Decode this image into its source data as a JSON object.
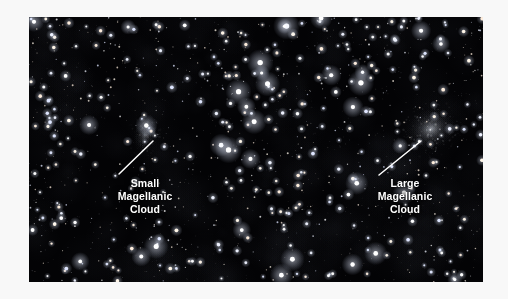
{
  "page": {
    "background_color": "#f8f8f8",
    "type": "astronomical-photograph"
  },
  "photo": {
    "background_color": "#030305",
    "description": "Dense night sky star field containing the two Magellanic Clouds",
    "frame": {
      "x": 29,
      "y": 17,
      "width": 454,
      "height": 265
    }
  },
  "annotations": [
    {
      "id": "small-magellanic-cloud",
      "lines": [
        "Small",
        "Magellanic",
        "Cloud"
      ],
      "text_color": "#ffffff",
      "leader_line": {
        "x1": 90,
        "y1": 157,
        "x2": 124,
        "y2": 124
      },
      "target": {
        "x": 117,
        "y": 118
      }
    },
    {
      "id": "large-magellanic-cloud",
      "lines": [
        "Large",
        "Magellanic",
        "Cloud"
      ],
      "text_color": "#ffffff",
      "leader_line": {
        "x1": 350,
        "y1": 158,
        "x2": 392,
        "y2": 124
      },
      "target": {
        "x": 399,
        "y": 117
      }
    }
  ],
  "objects": [
    {
      "name": "Small Magellanic Cloud",
      "center": {
        "x": 116,
        "y": 118
      },
      "radius_x": 13,
      "radius_y": 20,
      "rotation_deg": 15,
      "brightness": 0.34,
      "glow_color": "#cfd4de"
    },
    {
      "name": "Large Magellanic Cloud",
      "center": {
        "x": 402,
        "y": 112
      },
      "radius_x": 26,
      "radius_y": 21,
      "rotation_deg": -20,
      "brightness": 0.62,
      "glow_color": "#dde2ea"
    }
  ],
  "starfield": {
    "seed": 20240517,
    "star_count": 1350,
    "color_palette": [
      "#ffffff",
      "#eef2ff",
      "#fff6e8",
      "#dfe6ff",
      "#ffeedd"
    ],
    "max_radius": 1.9,
    "min_radius": 0.35
  }
}
